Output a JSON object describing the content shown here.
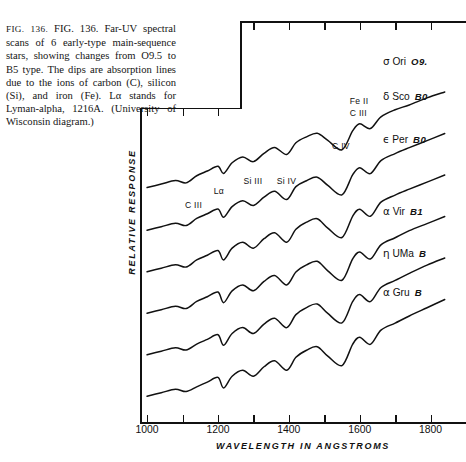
{
  "figure": {
    "number": "FIG. 136.",
    "caption_lines": [
      "Far-UV spectral scans of 6",
      "early-type main-sequence stars, showing",
      "changes from O9.5 to B5 type. The dips",
      "are absorption lines due to the ions of",
      "carbon (C), silicon (Si), and iron (Fe).",
      "Lα stands for Lyman-alpha, 1216A. (Uni-",
      "versity of Wisconsin diagram.)"
    ],
    "caption_full": "FIG. 136. Far-UV spectral scans of 6 early-type main-sequence stars, showing changes from O9.5 to B5 type. The dips are absorption lines due to the ions of carbon (C), silicon (Si), and iron (Fe). Lα stands for Lyman-alpha, 1216A. (University of Wisconsin diagram.)"
  },
  "axes": {
    "x_title": "WAVELENGTH IN ANGSTROMS",
    "y_title": "RELATIVE RESPONSE",
    "x_labels": [
      "1000",
      "1200",
      "1400",
      "1600",
      "1800"
    ],
    "x_label_values": [
      1000,
      1200,
      1400,
      1600,
      1800
    ],
    "x_tick_values": [
      1000,
      1100,
      1200,
      1300,
      1400,
      1500,
      1600,
      1700,
      1800,
      1900
    ],
    "x_min": 980,
    "x_max": 1900
  },
  "line_annotations": [
    {
      "id": "c-iii-low",
      "label": "C III",
      "x": 1135,
      "y_px": 200
    },
    {
      "id": "lyman-alpha",
      "label": "Lα",
      "x": 1216,
      "y_px": 186
    },
    {
      "id": "si-iii",
      "label": "Si III",
      "x": 1300,
      "y_px": 176
    },
    {
      "id": "si-iv",
      "label": "Si IV",
      "x": 1394,
      "y_px": 176
    },
    {
      "id": "c-iv",
      "label": "C IV",
      "x": 1550,
      "y_px": 141
    },
    {
      "id": "fe-ii",
      "label": "Fe II",
      "x": 1600,
      "y_px": 96
    },
    {
      "id": "c-iii-high",
      "label": "C III",
      "x": 1600,
      "y_px": 108
    }
  ],
  "stars": [
    {
      "name": "σ Ori",
      "greek": "σ",
      "designation": "Ori",
      "spectral_type": "O9.",
      "label_y_px": 55
    },
    {
      "name": "δ Sco",
      "greek": "δ",
      "designation": "Sco",
      "spectral_type": "B0",
      "label_y_px": 90
    },
    {
      "name": "ε Per",
      "greek": "ϵ",
      "designation": "Per",
      "spectral_type": "B0",
      "label_y_px": 133
    },
    {
      "name": "α Vir",
      "greek": "α",
      "designation": "Vir",
      "spectral_type": "B1",
      "label_y_px": 205
    },
    {
      "name": "η UMa",
      "greek": "η",
      "designation": "UMa",
      "spectral_type": "B",
      "label_y_px": 247
    },
    {
      "name": "α Gru",
      "greek": "α",
      "designation": "Gru",
      "spectral_type": "B",
      "label_y_px": 286
    }
  ],
  "chart_data": {
    "type": "line",
    "title": "Far-UV spectral scans of 6 early-type main-sequence stars",
    "xlabel": "WAVELENGTH IN ANGSTROMS",
    "ylabel": "RELATIVE RESPONSE",
    "xlim": [
      980,
      1900
    ],
    "ylim": [
      0,
      1
    ],
    "grid": false,
    "legend": "right-of-curves",
    "note": "Six vertically offset traces; y axis is relative response in arbitrary units with no numeric ticks.",
    "series": [
      {
        "name": "σ Ori O9.5",
        "offset_index": 0,
        "x": [
          1000,
          1040,
          1080,
          1110,
          1140,
          1170,
          1200,
          1216,
          1240,
          1270,
          1300,
          1330,
          1360,
          1394,
          1420,
          1450,
          1480,
          1510,
          1550,
          1580,
          1600,
          1630,
          1660,
          1700,
          1740,
          1790,
          1840
        ],
        "values": [
          0.12,
          0.15,
          0.18,
          0.16,
          0.22,
          0.26,
          0.3,
          0.24,
          0.33,
          0.38,
          0.34,
          0.41,
          0.46,
          0.4,
          0.5,
          0.55,
          0.58,
          0.52,
          0.44,
          0.6,
          0.66,
          0.62,
          0.72,
          0.78,
          0.82,
          0.88,
          0.93
        ]
      },
      {
        "name": "δ Sco B0",
        "offset_index": 1,
        "x": [
          1000,
          1040,
          1080,
          1110,
          1140,
          1170,
          1200,
          1216,
          1240,
          1270,
          1300,
          1330,
          1360,
          1394,
          1420,
          1450,
          1480,
          1510,
          1550,
          1580,
          1600,
          1630,
          1660,
          1700,
          1740,
          1790,
          1840
        ],
        "values": [
          0.1,
          0.13,
          0.16,
          0.14,
          0.2,
          0.24,
          0.28,
          0.21,
          0.3,
          0.35,
          0.31,
          0.38,
          0.43,
          0.36,
          0.47,
          0.52,
          0.55,
          0.48,
          0.4,
          0.57,
          0.63,
          0.58,
          0.69,
          0.75,
          0.8,
          0.86,
          0.92
        ]
      },
      {
        "name": "ε Per B0.5",
        "offset_index": 2,
        "x": [
          1000,
          1040,
          1080,
          1110,
          1140,
          1170,
          1200,
          1216,
          1240,
          1270,
          1300,
          1330,
          1360,
          1394,
          1420,
          1450,
          1480,
          1510,
          1550,
          1580,
          1600,
          1630,
          1660,
          1700,
          1740,
          1790,
          1840
        ],
        "values": [
          0.09,
          0.12,
          0.15,
          0.13,
          0.19,
          0.23,
          0.27,
          0.19,
          0.29,
          0.34,
          0.29,
          0.37,
          0.42,
          0.34,
          0.45,
          0.51,
          0.54,
          0.46,
          0.38,
          0.56,
          0.62,
          0.56,
          0.68,
          0.74,
          0.79,
          0.85,
          0.91
        ]
      },
      {
        "name": "α Vir B1",
        "offset_index": 3,
        "x": [
          1000,
          1040,
          1080,
          1110,
          1140,
          1170,
          1200,
          1216,
          1240,
          1270,
          1300,
          1330,
          1360,
          1394,
          1420,
          1450,
          1480,
          1510,
          1550,
          1580,
          1600,
          1630,
          1660,
          1700,
          1740,
          1790,
          1840
        ],
        "values": [
          0.08,
          0.11,
          0.14,
          0.12,
          0.18,
          0.22,
          0.26,
          0.17,
          0.27,
          0.32,
          0.27,
          0.35,
          0.4,
          0.32,
          0.43,
          0.49,
          0.52,
          0.44,
          0.36,
          0.54,
          0.6,
          0.54,
          0.66,
          0.72,
          0.78,
          0.84,
          0.9
        ]
      },
      {
        "name": "η UMa B3",
        "offset_index": 4,
        "x": [
          1000,
          1040,
          1080,
          1110,
          1140,
          1170,
          1200,
          1216,
          1240,
          1270,
          1300,
          1330,
          1360,
          1394,
          1420,
          1450,
          1480,
          1510,
          1550,
          1580,
          1600,
          1630,
          1660,
          1700,
          1740,
          1790,
          1840
        ],
        "values": [
          0.07,
          0.1,
          0.13,
          0.11,
          0.16,
          0.2,
          0.24,
          0.15,
          0.25,
          0.3,
          0.25,
          0.33,
          0.38,
          0.3,
          0.41,
          0.47,
          0.5,
          0.42,
          0.34,
          0.52,
          0.58,
          0.52,
          0.64,
          0.7,
          0.76,
          0.83,
          0.89
        ]
      },
      {
        "name": "α Gru B5",
        "offset_index": 5,
        "x": [
          1000,
          1040,
          1080,
          1110,
          1140,
          1170,
          1200,
          1216,
          1240,
          1270,
          1300,
          1330,
          1360,
          1394,
          1420,
          1450,
          1480,
          1510,
          1550,
          1580,
          1600,
          1630,
          1660,
          1700,
          1740,
          1790,
          1840
        ],
        "values": [
          0.06,
          0.09,
          0.12,
          0.1,
          0.14,
          0.18,
          0.22,
          0.13,
          0.23,
          0.28,
          0.23,
          0.31,
          0.36,
          0.28,
          0.39,
          0.45,
          0.48,
          0.4,
          0.32,
          0.5,
          0.56,
          0.5,
          0.62,
          0.68,
          0.74,
          0.81,
          0.88
        ]
      }
    ]
  }
}
